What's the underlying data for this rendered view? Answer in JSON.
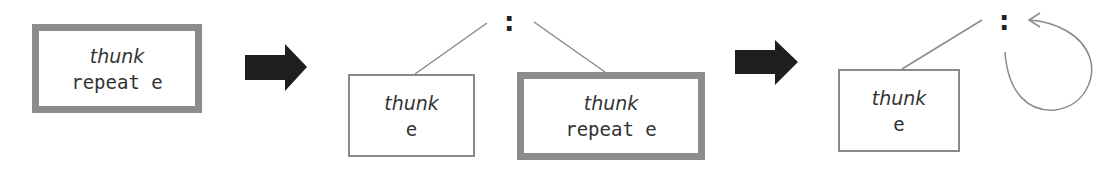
{
  "diagram": {
    "step1": {
      "box": {
        "label": "thunk",
        "expr": "repeat e"
      }
    },
    "step2": {
      "cons": ":",
      "head": {
        "label": "thunk",
        "expr": "e"
      },
      "tail": {
        "label": "thunk",
        "expr": "repeat e"
      }
    },
    "step3": {
      "cons": ":",
      "head": {
        "label": "thunk",
        "expr": "e"
      },
      "tail": "self-loop"
    },
    "colors": {
      "border": "#8c8c8c",
      "arrow": "#1e1e1e",
      "line": "#8a8a8a",
      "text": "#333333"
    }
  }
}
